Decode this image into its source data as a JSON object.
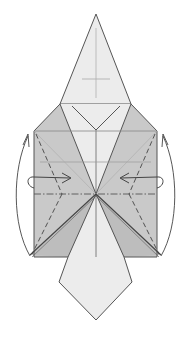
{
  "diagram": {
    "type": "origami-folding-step",
    "colors": {
      "background": "#ffffff",
      "paper_light": "#ececec",
      "paper_dark": "#c8c8c8",
      "paper_mid": "#d8d8d8",
      "line": "#555555",
      "crease": "#9a9a9a"
    },
    "annotations": {
      "left_side_arrow": "fold-behind arrow (left edge flap up)",
      "right_side_arrow": "fold-behind arrow (right edge flap up)",
      "left_inner_arrow": "turn-over / fold inward arrow (left)",
      "right_inner_arrow": "turn-over / fold inward arrow (right)"
    }
  }
}
